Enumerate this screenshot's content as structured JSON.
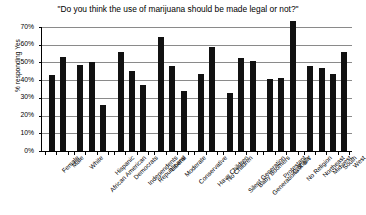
{
  "chart_data": {
    "type": "bar",
    "title": "\"Do you think the use of marijuana should be made legal or not?\"",
    "xlabel": "",
    "ylabel": "% responding Yes",
    "ylim": [
      0,
      70
    ],
    "ytick_labels": [
      "0%",
      "10%",
      "20%",
      "30%",
      "40%",
      "50%",
      "60%",
      "70%"
    ],
    "ytick_values": [
      0,
      10,
      20,
      30,
      40,
      50,
      60,
      70
    ],
    "grid": true,
    "legend": "none",
    "orientation": "vertical",
    "bar_color": "#111111",
    "gridline_color": "#8a8a8a",
    "categories": [
      "Female",
      "Male",
      "White",
      "African American",
      "Hispanic",
      "Democrats",
      "Independents",
      "Republicans",
      "Liberal",
      "Moderate",
      "Conservative",
      "Have Children",
      "No Children",
      "Silent Generation",
      "Baby Boomers",
      "Generations X & Y",
      "Protestant",
      "Catholic",
      "No Religion",
      "Northeast",
      "Midwest",
      "South",
      "West"
    ],
    "values": [
      43,
      53,
      48.5,
      50,
      26,
      56,
      45,
      37,
      64.5,
      48,
      34,
      43.5,
      58.5,
      33,
      52.5,
      51,
      40.5,
      41.5,
      73.5,
      48,
      47,
      43.5,
      56
    ],
    "groups": [
      {
        "name": "Gender",
        "count": 2
      },
      {
        "name": "Race",
        "count": 3
      },
      {
        "name": "Party",
        "count": 3
      },
      {
        "name": "Ideology",
        "count": 3
      },
      {
        "name": "Children",
        "count": 2
      },
      {
        "name": "Generation",
        "count": 3
      },
      {
        "name": "Religion",
        "count": 3
      },
      {
        "name": "Region",
        "count": 4
      }
    ]
  }
}
